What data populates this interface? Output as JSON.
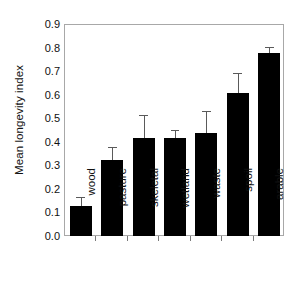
{
  "chart_data": {
    "type": "bar",
    "title": "",
    "subtitle": "",
    "xlabel": "",
    "ylabel": "Mean longevity index",
    "categories": [
      "wood",
      "pasture",
      "skeletal",
      "wetland",
      "waste",
      "spoil",
      "arable"
    ],
    "values": [
      0.13,
      0.325,
      0.42,
      0.42,
      0.44,
      0.61,
      0.78
    ],
    "errors": [
      0.04,
      0.055,
      0.1,
      0.035,
      0.095,
      0.085,
      0.025
    ],
    "error_upper": [
      0.17,
      0.38,
      0.52,
      0.455,
      0.535,
      0.695,
      0.805
    ],
    "ylim": [
      0.0,
      0.9
    ],
    "ytick_values": [
      0.0,
      0.1,
      0.2,
      0.3,
      0.4,
      0.5,
      0.6,
      0.7,
      0.8,
      0.9
    ],
    "ytick_labels": [
      "0.0",
      "0.1",
      "0.2",
      "0.3",
      "0.4",
      "0.5",
      "0.6",
      "0.7",
      "0.8",
      "0.9"
    ],
    "grid": false,
    "legend": null,
    "legend_position": "none",
    "bar_color": "#000000",
    "error_color": "#5a5a5a",
    "frame_color": "#a8a8a8",
    "error_bars": "upper-only",
    "xlabel_rotation": -90
  },
  "figure": {
    "background": "#ffffff",
    "axis_text_color": "#111111"
  }
}
